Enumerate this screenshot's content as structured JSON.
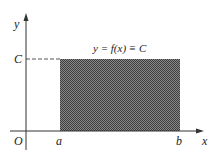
{
  "diagram": {
    "axis_labels": {
      "x": "x",
      "y": "y",
      "origin": "O"
    },
    "tick_labels": {
      "a": "a",
      "b": "b",
      "C": "C"
    },
    "function_label": "y = f(x) ≡ C",
    "colors": {
      "fill": "#5a5a5a",
      "axis": "#333333",
      "dash": "#555555"
    }
  }
}
